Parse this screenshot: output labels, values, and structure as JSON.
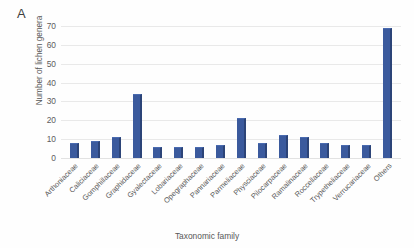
{
  "panel": {
    "letter": "A"
  },
  "chart_data": {
    "type": "bar",
    "title": "",
    "xlabel": "Taxonomic family",
    "ylabel": "Number of lichen genera",
    "ylim": [
      0,
      70
    ],
    "yticks": [
      0,
      10,
      20,
      30,
      40,
      50,
      60,
      70
    ],
    "grid": true,
    "legend": false,
    "bar_color": "#3b5a9d",
    "categories": [
      "Arthoniaceae",
      "Caliciaceae",
      "Gomphillaceae",
      "Graphidaceae",
      "Gyalectaceae",
      "Lobariaceae",
      "Opegraphaceae",
      "Pannariaceae",
      "Parmeliaceae",
      "Physciaceae",
      "Pilocarpaceae",
      "Ramalinaceae",
      "Roccellaceae",
      "Trypetheliaceae",
      "Verrucariaceae",
      "Others"
    ],
    "values": [
      8,
      9,
      11,
      34,
      6,
      6,
      6,
      7,
      21,
      8,
      12,
      11,
      8,
      7,
      7,
      69
    ]
  }
}
